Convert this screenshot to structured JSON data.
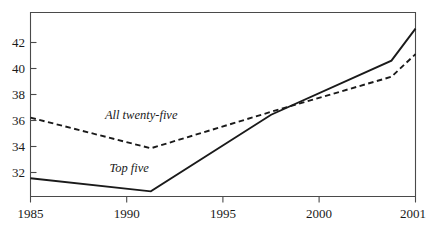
{
  "chart_data": {
    "type": "line",
    "title": "",
    "subtitle": "",
    "xlabel": "",
    "ylabel": "",
    "x": [
      1985,
      1990,
      1995,
      2000,
      2001
    ],
    "xtick_labels": [
      "1985",
      "1990",
      "1995",
      "2000",
      "2001"
    ],
    "ytick_labels": [
      "32",
      "34",
      "36",
      "38",
      "40",
      "42"
    ],
    "yticks": [
      32,
      34,
      36,
      38,
      40,
      42
    ],
    "xlim": [
      1985,
      2001
    ],
    "ylim": [
      30.6,
      43.2
    ],
    "grid": false,
    "legend_position": "inline-annotation",
    "series": [
      {
        "name": "All twenty-five",
        "style": "dashed",
        "color": "#1a1a1a",
        "values": [
          36.0,
          33.9,
          36.4,
          38.8,
          40.35
        ]
      },
      {
        "name": "Top five",
        "style": "solid",
        "color": "#1a1a1a",
        "values": [
          31.85,
          30.95,
          36.2,
          39.9,
          42.1
        ]
      }
    ],
    "annotations": [
      {
        "text": "All twenty-five",
        "x": 1989.6,
        "y": 35.9
      },
      {
        "text": "Top five",
        "x": 1989.1,
        "y": 32.3
      }
    ]
  }
}
